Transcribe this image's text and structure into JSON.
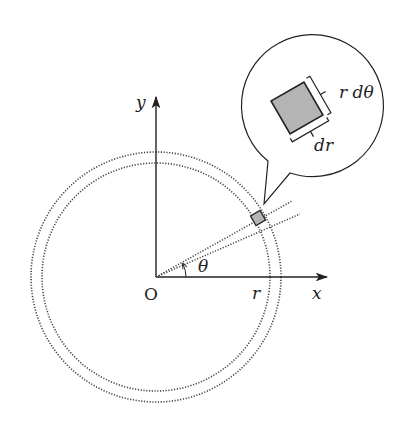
{
  "figure": {
    "labels": {
      "y_axis": "y",
      "x_axis": "x",
      "origin": "O",
      "radius": "r",
      "angle": "θ",
      "callout_side_arc": "r dθ",
      "callout_side_radial": "dr"
    },
    "colors": {
      "line": "#222222",
      "dotted": "#444444",
      "element_fill": "#b4b4b4"
    },
    "geometry": {
      "origin": [
        156,
        277
      ],
      "inner_radius": 114,
      "outer_radius": 125,
      "theta_deg": 28,
      "dtheta_deg": 5,
      "callout_center": [
        306,
        104
      ],
      "callout_radius": 71
    }
  }
}
